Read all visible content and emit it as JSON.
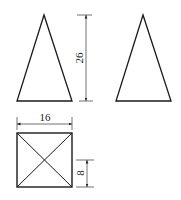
{
  "drawing": {
    "type": "three-view orthographic projection",
    "views": [
      {
        "name": "front-view",
        "shape": "isosceles triangle"
      },
      {
        "name": "side-view",
        "shape": "isosceles triangle"
      },
      {
        "name": "top-view",
        "shape": "square with diagonals"
      }
    ],
    "dimensions": {
      "height": "26",
      "width": "16",
      "half_depth": "8"
    },
    "colors": {
      "line": "#1a1a1a",
      "background": "#ffffff"
    }
  }
}
